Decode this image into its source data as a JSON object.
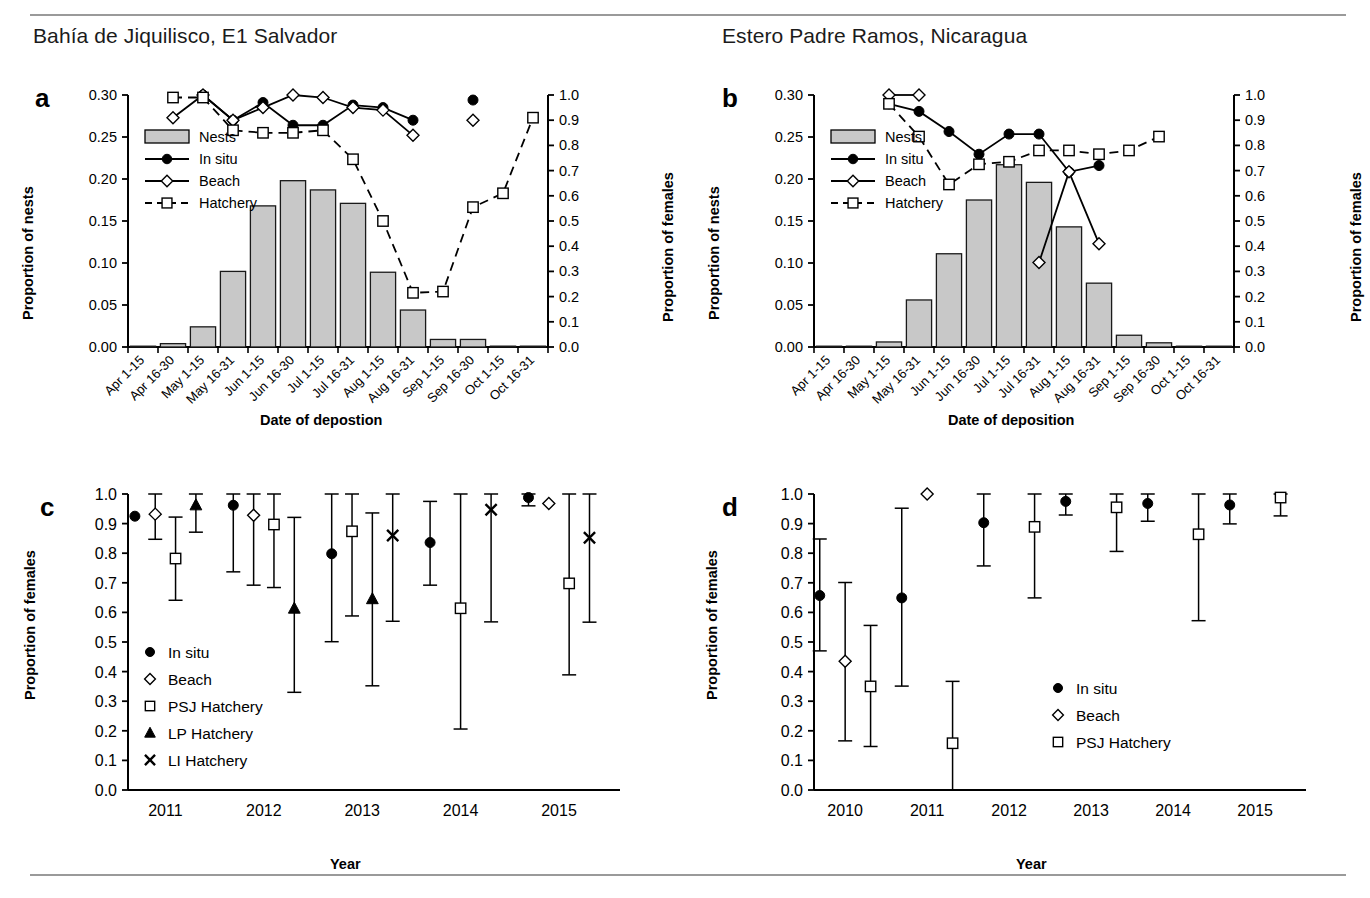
{
  "figure": {
    "panels": [
      "a",
      "b",
      "c",
      "d"
    ],
    "letter_a": "a",
    "letter_b": "b",
    "letter_c": "c",
    "letter_d": "d",
    "title_a": "Bahía de Jiquilisco, E1 Salvador",
    "title_b": "Estero Padre Ramos, Nicaragua"
  },
  "axis_labels": {
    "proportion_of_nests": "Proportion of nests",
    "proportion_of_females": "Proportion of females",
    "date_of_deposition_a": "Date of depostion",
    "date_of_deposition_b": "Date of deposition",
    "year": "Year"
  },
  "legend_labels": {
    "nests": "Nests",
    "in_situ": "In situ",
    "beach": "Beach",
    "hatchery": "Hatchery",
    "psj_hatchery": "PSJ Hatchery",
    "lp_hatchery": "LP Hatchery",
    "li_hatchery": "LI Hatchery"
  },
  "colors": {
    "bar_fill": "#c8c8c8",
    "bar_stroke": "#1a1a1a",
    "line": "#000000",
    "marker_fill_open": "#ffffff",
    "rule": "#9a9a9a"
  },
  "chart_data": [
    {
      "panel": "a",
      "type": "bar",
      "title": "Bahía de Jiquilisco, E1 Salvador",
      "xlabel": "Date of depostion",
      "ylabel": "Proportion of nests",
      "y2label": "Proportion of females",
      "ylim": [
        0.0,
        0.3
      ],
      "y2lim": [
        0.0,
        1.0
      ],
      "yticks": [
        "0.00",
        "0.05",
        "0.10",
        "0.15",
        "0.20",
        "0.25",
        "0.30"
      ],
      "y2ticks": [
        "0.0",
        "0.1",
        "0.2",
        "0.3",
        "0.4",
        "0.5",
        "0.6",
        "0.7",
        "0.8",
        "0.9",
        "1.0"
      ],
      "grid": false,
      "legend_position": "upper-left-inside",
      "categories": [
        "Apr 1-15",
        "Apr 16-30",
        "May 1-15",
        "May 16-31",
        "Jun 1-15",
        "Jun 16-30",
        "Jul 1-15",
        "Jul 16-31",
        "Aug 1-15",
        "Aug 16-31",
        "Sep 1-15",
        "Sep 16-30",
        "Oct 1-15",
        "Oct 16-31"
      ],
      "series": [
        {
          "name": "Nests",
          "kind": "bar",
          "axis": "left",
          "values": [
            0.0,
            0.004,
            0.024,
            0.09,
            0.168,
            0.198,
            0.187,
            0.171,
            0.089,
            0.044,
            0.009,
            0.009,
            0.001,
            0.001
          ]
        },
        {
          "name": "In situ",
          "kind": "line-filled-circle",
          "axis": "right",
          "values": [
            null,
            null,
            1.0,
            0.9,
            0.97,
            0.88,
            0.88,
            0.96,
            0.95,
            0.9,
            null,
            0.98,
            null,
            null
          ]
        },
        {
          "name": "Beach",
          "kind": "line-open-diamond",
          "axis": "right",
          "values": [
            null,
            0.91,
            1.0,
            0.9,
            0.95,
            1.0,
            0.99,
            0.95,
            0.94,
            0.84,
            null,
            0.9,
            null,
            null
          ]
        },
        {
          "name": "Hatchery",
          "kind": "dashed-open-square",
          "axis": "right",
          "values": [
            null,
            0.99,
            0.99,
            0.86,
            0.85,
            0.85,
            0.86,
            0.745,
            0.5,
            0.215,
            0.22,
            0.555,
            0.61,
            0.91
          ]
        }
      ]
    },
    {
      "panel": "b",
      "type": "bar",
      "title": "Estero Padre Ramos, Nicaragua",
      "xlabel": "Date of deposition",
      "ylabel": "Proportion of nests",
      "y2label": "Proportion of females",
      "ylim": [
        0.0,
        0.3
      ],
      "y2lim": [
        0.0,
        1.0
      ],
      "yticks": [
        "0.00",
        "0.05",
        "0.10",
        "0.15",
        "0.20",
        "0.25",
        "0.30"
      ],
      "y2ticks": [
        "0.0",
        "0.1",
        "0.2",
        "0.3",
        "0.4",
        "0.5",
        "0.6",
        "0.7",
        "0.8",
        "0.9",
        "1.0"
      ],
      "grid": false,
      "legend_position": "upper-left-inside",
      "categories": [
        "Apr 1-15",
        "Apr 16-30",
        "May 1-15",
        "May 16-31",
        "Jun 1-15",
        "Jun 16-30",
        "Jul 1-15",
        "Jul 16-31",
        "Aug 1-15",
        "Aug 16-31",
        "Sep 1-15",
        "Sep 16-30",
        "Oct 1-15",
        "Oct 16-31"
      ],
      "series": [
        {
          "name": "Nests",
          "kind": "bar",
          "axis": "left",
          "values": [
            0.0,
            0.0,
            0.006,
            0.056,
            0.111,
            0.175,
            0.217,
            0.196,
            0.143,
            0.076,
            0.014,
            0.005,
            0.0,
            0.0
          ]
        },
        {
          "name": "In situ",
          "kind": "line-filled-circle",
          "axis": "right",
          "values": [
            null,
            null,
            0.965,
            0.935,
            0.855,
            0.765,
            0.845,
            0.845,
            0.695,
            0.72,
            null,
            null,
            null,
            null
          ]
        },
        {
          "name": "Beach",
          "kind": "line-open-diamond",
          "axis": "right",
          "values": [
            null,
            null,
            1.0,
            1.0,
            null,
            null,
            null,
            0.335,
            0.695,
            0.41,
            null,
            null,
            null,
            null
          ]
        },
        {
          "name": "Hatchery",
          "kind": "dashed-open-square",
          "axis": "right",
          "values": [
            null,
            null,
            0.965,
            0.835,
            0.645,
            0.725,
            0.735,
            0.78,
            0.78,
            0.765,
            0.78,
            0.835,
            null,
            null
          ]
        }
      ]
    },
    {
      "panel": "c",
      "type": "scatter-errorbar",
      "xlabel": "Year",
      "ylabel": "Proportion of females",
      "ylim": [
        0.0,
        1.0
      ],
      "yticks": [
        "0.0",
        "0.1",
        "0.2",
        "0.3",
        "0.4",
        "0.5",
        "0.6",
        "0.7",
        "0.8",
        "0.9",
        "1.0"
      ],
      "grid": false,
      "legend_position": "lower-left-inside",
      "categories": [
        "2011",
        "2012",
        "2013",
        "2014",
        "2015"
      ],
      "series": [
        {
          "name": "In situ",
          "marker": "filled-circle",
          "points": [
            {
              "x": "2011",
              "y": 0.925,
              "lo": 0.925,
              "hi": 0.925
            },
            {
              "x": "2012",
              "y": 0.962,
              "lo": 0.737,
              "hi": 1.0
            },
            {
              "x": "2013",
              "y": 0.798,
              "lo": 0.501,
              "hi": 1.0
            },
            {
              "x": "2014",
              "y": 0.836,
              "lo": 0.692,
              "hi": 0.975
            },
            {
              "x": "2015",
              "y": 0.988,
              "lo": 0.96,
              "hi": 1.0
            }
          ]
        },
        {
          "name": "Beach",
          "marker": "open-diamond",
          "points": [
            {
              "x": "2011",
              "y": 0.932,
              "lo": 0.847,
              "hi": 1.0
            },
            {
              "x": "2012",
              "y": 0.928,
              "lo": 0.692,
              "hi": 1.0
            },
            {
              "x": "2015",
              "y": 0.968,
              "lo": 0.968,
              "hi": 0.968
            }
          ]
        },
        {
          "name": "PSJ Hatchery",
          "marker": "open-square",
          "points": [
            {
              "x": "2011",
              "y": 0.782,
              "lo": 0.641,
              "hi": 0.922
            },
            {
              "x": "2012",
              "y": 0.897,
              "lo": 0.684,
              "hi": 1.0
            },
            {
              "x": "2013",
              "y": 0.874,
              "lo": 0.588,
              "hi": 1.0
            },
            {
              "x": "2014",
              "y": 0.614,
              "lo": 0.206,
              "hi": 1.0
            },
            {
              "x": "2015",
              "y": 0.698,
              "lo": 0.389,
              "hi": 1.0
            }
          ]
        },
        {
          "name": "LP Hatchery",
          "marker": "filled-triangle",
          "points": [
            {
              "x": "2011",
              "y": 0.962,
              "lo": 0.871,
              "hi": 1.0
            },
            {
              "x": "2012",
              "y": 0.613,
              "lo": 0.33,
              "hi": 0.921
            },
            {
              "x": "2013",
              "y": 0.645,
              "lo": 0.352,
              "hi": 0.936
            }
          ]
        },
        {
          "name": "LI Hatchery",
          "marker": "cross-x",
          "points": [
            {
              "x": "2013",
              "y": 0.86,
              "lo": 0.57,
              "hi": 1.0
            },
            {
              "x": "2014",
              "y": 0.947,
              "lo": 0.568,
              "hi": 1.0
            },
            {
              "x": "2015",
              "y": 0.852,
              "lo": 0.567,
              "hi": 1.0
            }
          ]
        }
      ]
    },
    {
      "panel": "d",
      "type": "scatter-errorbar",
      "xlabel": "Year",
      "ylabel": "Proportion of females",
      "ylim": [
        0.0,
        1.0
      ],
      "yticks": [
        "0.0",
        "0.1",
        "0.2",
        "0.3",
        "0.4",
        "0.5",
        "0.6",
        "0.7",
        "0.8",
        "0.9",
        "1.0"
      ],
      "grid": false,
      "legend_position": "lower-right-inside",
      "categories": [
        "2010",
        "2011",
        "2012",
        "2013",
        "2014",
        "2015"
      ],
      "series": [
        {
          "name": "In situ",
          "marker": "filled-circle",
          "points": [
            {
              "x": "2010",
              "y": 0.657,
              "lo": 0.47,
              "hi": 0.848
            },
            {
              "x": "2011",
              "y": 0.649,
              "lo": 0.351,
              "hi": 0.952
            },
            {
              "x": "2012",
              "y": 0.903,
              "lo": 0.757,
              "hi": 1.0
            },
            {
              "x": "2013",
              "y": 0.975,
              "lo": 0.929,
              "hi": 1.0
            },
            {
              "x": "2014",
              "y": 0.968,
              "lo": 0.908,
              "hi": 1.0
            },
            {
              "x": "2015",
              "y": 0.963,
              "lo": 0.899,
              "hi": 1.0
            }
          ]
        },
        {
          "name": "Beach",
          "marker": "open-diamond",
          "points": [
            {
              "x": "2010",
              "y": 0.435,
              "lo": 0.166,
              "hi": 0.701
            },
            {
              "x": "2011",
              "y": 1.0,
              "lo": 1.0,
              "hi": 1.0
            }
          ]
        },
        {
          "name": "PSJ Hatchery",
          "marker": "open-square",
          "points": [
            {
              "x": "2010",
              "y": 0.35,
              "lo": 0.147,
              "hi": 0.556
            },
            {
              "x": "2011",
              "y": 0.158,
              "lo": 0.0,
              "hi": 0.367
            },
            {
              "x": "2012",
              "y": 0.889,
              "lo": 0.649,
              "hi": 1.0
            },
            {
              "x": "2013",
              "y": 0.955,
              "lo": 0.806,
              "hi": 1.0
            },
            {
              "x": "2014",
              "y": 0.864,
              "lo": 0.572,
              "hi": 1.0
            },
            {
              "x": "2015",
              "y": 0.988,
              "lo": 0.926,
              "hi": 1.0
            }
          ]
        }
      ]
    }
  ]
}
